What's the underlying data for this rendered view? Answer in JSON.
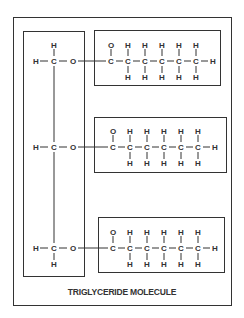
{
  "diagram": {
    "caption": "TRIGLYCERIDE MOLECULE",
    "glycerol_backbone": {
      "rows": [
        {
          "left": "H",
          "center": "C",
          "right": "O",
          "top": "H",
          "bottom": null
        },
        {
          "left": "H",
          "center": "C",
          "right": "O",
          "top": null,
          "bottom": null
        },
        {
          "left": "H",
          "center": "C",
          "right": "O",
          "top": null,
          "bottom": "H"
        }
      ]
    },
    "fatty_acid_chains": [
      {
        "carbonyl_oxygen": "O",
        "carbons": [
          "C",
          "C",
          "C",
          "C",
          "C",
          "C"
        ],
        "terminal": "H",
        "top_h": [
          "H",
          "H",
          "H",
          "H",
          "H"
        ],
        "bottom_h": [
          "H",
          "H",
          "H",
          "H",
          "H"
        ]
      },
      {
        "carbonyl_oxygen": "O",
        "carbons": [
          "C",
          "C",
          "C",
          "C",
          "C",
          "C"
        ],
        "terminal": "H",
        "top_h": [
          "H",
          "H",
          "H",
          "H",
          "H"
        ],
        "bottom_h": [
          "H",
          "H",
          "H",
          "H",
          "H"
        ]
      },
      {
        "carbonyl_oxygen": "O",
        "carbons": [
          "C",
          "C",
          "C",
          "C",
          "C",
          "C"
        ],
        "terminal": "H",
        "top_h": [
          "H",
          "H",
          "H",
          "H",
          "H"
        ],
        "bottom_h": [
          "H",
          "H",
          "H",
          "H",
          "H"
        ]
      }
    ]
  }
}
